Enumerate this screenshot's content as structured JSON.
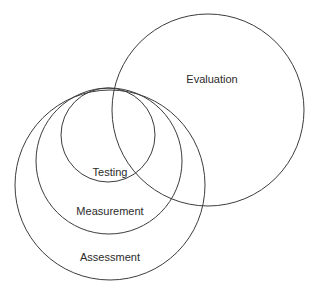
{
  "diagram": {
    "background_color": "#ffffff",
    "stroke_color": "#3c3c3c",
    "text_color": "#2b2b2b",
    "labels": {
      "evaluation": "Evaluation",
      "testing": "Testing",
      "measurement": "Measurement",
      "assessment": "Assessment"
    }
  },
  "chart_data": {
    "type": "diagram",
    "subtype": "venn-nested-circles",
    "title": "",
    "background": "#ffffff",
    "stroke": "#3c3c3c",
    "circles": [
      {
        "name": "Evaluation",
        "label": "Evaluation",
        "cx": 208,
        "cy": 110,
        "r": 96,
        "label_x": 212,
        "label_y": 83
      },
      {
        "name": "Assessment",
        "label": "Assessment",
        "cx": 110,
        "cy": 185,
        "r": 95,
        "label_x": 110,
        "label_y": 261
      },
      {
        "name": "Measurement",
        "label": "Measurement",
        "cx": 109,
        "cy": 161,
        "r": 73,
        "label_x": 110,
        "label_y": 215
      },
      {
        "name": "Testing",
        "label": "Testing",
        "cx": 108,
        "cy": 135,
        "r": 47,
        "label_x": 110,
        "label_y": 176
      }
    ],
    "relations": [
      "Testing is contained within Measurement",
      "Measurement is contained within Assessment",
      "Testing, Measurement and Assessment are tangent near the top point",
      "Evaluation overlaps Testing, Measurement and Assessment on their right side"
    ]
  }
}
